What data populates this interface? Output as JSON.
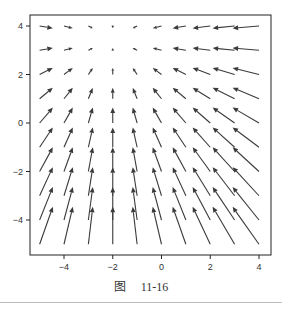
{
  "chart_data": {
    "type": "quiver",
    "title": "",
    "xlabel": "",
    "ylabel": "",
    "xlim": [
      -5.5,
      4.5
    ],
    "ylim": [
      -5.5,
      4.5
    ],
    "grid": false,
    "legend": null,
    "x_ticks": [
      -4,
      -2,
      0,
      2,
      4
    ],
    "y_ticks": [
      -4,
      -2,
      0,
      2,
      4
    ],
    "x_tick_labels": [
      "−4",
      "−2",
      "0",
      "2",
      "4"
    ],
    "y_tick_labels": [
      "−4",
      "−2",
      "0",
      "2",
      "4"
    ],
    "grid_x": [
      -5,
      -4,
      -3,
      -2,
      -1,
      0,
      1,
      2,
      3,
      4
    ],
    "grid_y": [
      -5,
      -4,
      -3,
      -2,
      -1,
      0,
      1,
      2,
      3,
      4
    ],
    "field": {
      "description": "approximate vector field: U = -(x + 2), V = 3.5 - y",
      "u_center_x": -2,
      "v_center_y": 3.5
    },
    "arrow_color": "#3a3a3a"
  },
  "caption": {
    "prefix": "图",
    "number": "11-16"
  }
}
